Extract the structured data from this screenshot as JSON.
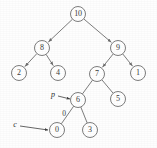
{
  "figure": {
    "type": "binary-tree-diagram",
    "background_color": "#fefefe",
    "stroke_color": "#6e6e6e",
    "text_color": "#3b3b3b",
    "node_fill": "#ffffff",
    "node_radius": 7.5
  },
  "chart_data": {
    "type": "diagram",
    "title": "",
    "nodes": [
      {
        "id": "n10",
        "label": "10",
        "x": 78,
        "y": 14
      },
      {
        "id": "n8",
        "label": "8",
        "x": 42,
        "y": 48
      },
      {
        "id": "n9",
        "label": "9",
        "x": 118,
        "y": 48
      },
      {
        "id": "n2",
        "label": "2",
        "x": 19,
        "y": 73
      },
      {
        "id": "n4",
        "label": "4",
        "x": 58,
        "y": 73
      },
      {
        "id": "n7",
        "label": "7",
        "x": 97,
        "y": 74
      },
      {
        "id": "n1",
        "label": "1",
        "x": 138,
        "y": 73
      },
      {
        "id": "n6",
        "label": "6",
        "x": 78,
        "y": 100
      },
      {
        "id": "n5",
        "label": "5",
        "x": 118,
        "y": 99
      },
      {
        "id": "n0",
        "label": "0",
        "x": 57,
        "y": 130
      },
      {
        "id": "n3",
        "label": "3",
        "x": 90,
        "y": 130
      }
    ],
    "edges": [
      {
        "from": "n10",
        "to": "n8",
        "arrow": true
      },
      {
        "from": "n10",
        "to": "n9",
        "arrow": true
      },
      {
        "from": "n8",
        "to": "n2",
        "arrow": true
      },
      {
        "from": "n8",
        "to": "n4",
        "arrow": true
      },
      {
        "from": "n9",
        "to": "n7",
        "arrow": true
      },
      {
        "from": "n9",
        "to": "n1",
        "arrow": true
      },
      {
        "from": "n7",
        "to": "n6",
        "arrow": false
      },
      {
        "from": "n7",
        "to": "n5",
        "arrow": false
      },
      {
        "from": "n6",
        "to": "n0",
        "arrow": false
      },
      {
        "from": "n6",
        "to": "n3",
        "arrow": false
      }
    ],
    "edge_labels": [
      {
        "id": "el0",
        "text": "0",
        "x": 64,
        "y": 113
      }
    ],
    "pointers": [
      {
        "id": "p",
        "label": "p",
        "label_x": 53,
        "label_y": 94,
        "target": "n6",
        "arrow_from_x": 58,
        "arrow_from_y": 96,
        "arrow_to_x": 70,
        "arrow_to_y": 99
      },
      {
        "id": "c",
        "label": "c",
        "label_x": 15,
        "label_y": 124,
        "target": "n0",
        "arrow_from_x": 20,
        "arrow_from_y": 126,
        "arrow_to_x": 48,
        "arrow_to_y": 130
      }
    ]
  }
}
